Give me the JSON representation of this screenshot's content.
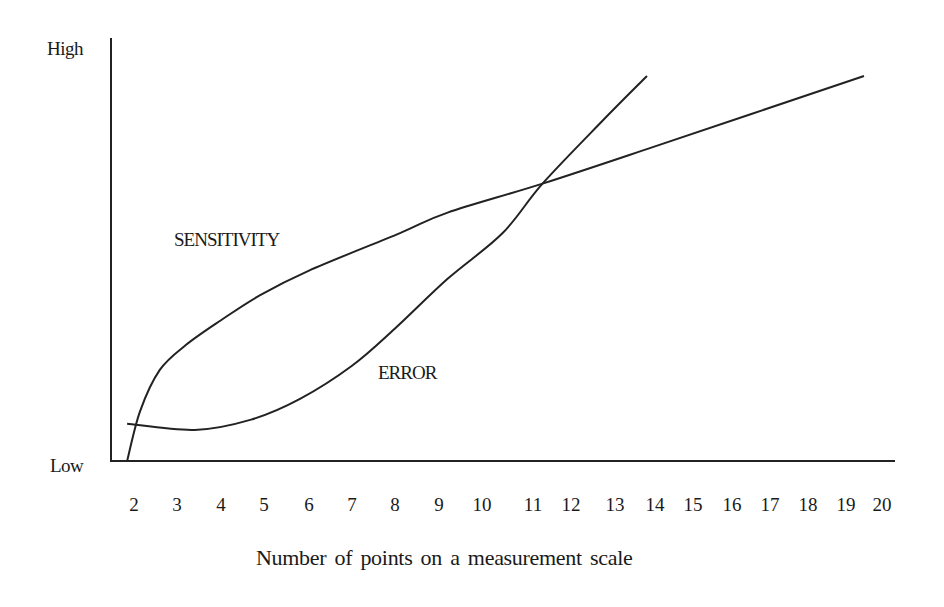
{
  "chart_data": {
    "type": "line",
    "title": "",
    "xlabel": "Number of points on a measurement scale",
    "ylabel": "",
    "y_tick_labels": {
      "low": "Low",
      "high": "High"
    },
    "x_ticks": [
      2,
      3,
      4,
      5,
      6,
      7,
      8,
      9,
      10,
      11,
      12,
      13,
      14,
      15,
      16,
      17,
      18,
      19,
      20
    ],
    "xlim": [
      1.5,
      20.3
    ],
    "ylim": [
      0,
      100
    ],
    "grid": false,
    "legend": "none (inline labels)",
    "series": [
      {
        "name": "SENSITIVITY",
        "label_position": {
          "x": 4.5,
          "y": 54
        },
        "points": [
          [
            1.84,
            0
          ],
          [
            2.14,
            12
          ],
          [
            2.6,
            22
          ],
          [
            3.2,
            28
          ],
          [
            4.0,
            34
          ],
          [
            4.9,
            40
          ],
          [
            6.0,
            46
          ],
          [
            8.1,
            55
          ],
          [
            9.2,
            60
          ],
          [
            11.25,
            67
          ],
          [
            14.0,
            76
          ],
          [
            19.5,
            93
          ]
        ]
      },
      {
        "name": "ERROR",
        "label_position": {
          "x": 8.0,
          "y": 21
        },
        "points": [
          [
            1.84,
            9
          ],
          [
            3.4,
            7.5
          ],
          [
            4.7,
            10
          ],
          [
            5.8,
            15
          ],
          [
            7.0,
            23
          ],
          [
            8.0,
            32
          ],
          [
            9.2,
            44
          ],
          [
            10.4,
            55
          ],
          [
            11.25,
            67
          ],
          [
            12.7,
            82
          ],
          [
            13.8,
            93
          ]
        ]
      }
    ],
    "annotations": [
      "Curves intersect near x ≈ 11.25"
    ]
  },
  "labels": {
    "high": "High",
    "low": "Low",
    "xlabel": "Number of points on a measurement scale",
    "sensitivity": "SENSITIVITY",
    "error": "ERROR",
    "ticks": [
      "2",
      "3",
      "4",
      "5",
      "6",
      "7",
      "8",
      "9",
      "10",
      "11",
      "12",
      "13",
      "14",
      "15",
      "16",
      "17",
      "18",
      "19",
      "20"
    ]
  }
}
